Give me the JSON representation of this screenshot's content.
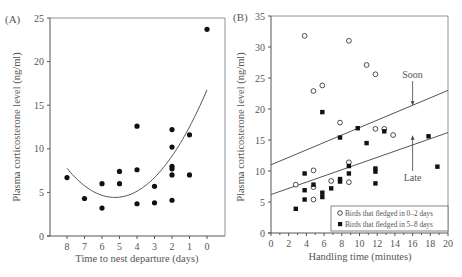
{
  "chart_data": [
    {
      "panel": "(A)",
      "type": "scatter",
      "title": "",
      "xlabel": "Time to nest departure (days)",
      "ylabel": "Plasma corticosterone level (ng/ml)",
      "x_reversed": true,
      "xlim": [
        8.9,
        -1
      ],
      "ylim": [
        0,
        25
      ],
      "xticks": [
        8,
        7,
        6,
        5,
        4,
        3,
        2,
        1,
        0
      ],
      "yticks": [
        0,
        5,
        10,
        15,
        20,
        25
      ],
      "grid": false,
      "series": [
        {
          "name": "Birds",
          "marker": "filled-circle",
          "points": [
            [
              8,
              6.7
            ],
            [
              7,
              4.3
            ],
            [
              6,
              6.0
            ],
            [
              6,
              3.2
            ],
            [
              5,
              7.4
            ],
            [
              5,
              6.0
            ],
            [
              4,
              12.6
            ],
            [
              4,
              7.6
            ],
            [
              4,
              3.7
            ],
            [
              3,
              5.7
            ],
            [
              3,
              3.8
            ],
            [
              2,
              12.2
            ],
            [
              2,
              10.2
            ],
            [
              2,
              8.0
            ],
            [
              2,
              7.7
            ],
            [
              2,
              7.0
            ],
            [
              2,
              4.1
            ],
            [
              1,
              11.6
            ],
            [
              1,
              7.0
            ],
            [
              0,
              23.7
            ]
          ]
        }
      ],
      "fit": {
        "type": "quadratic",
        "points": [
          [
            8,
            7.7
          ],
          [
            7,
            5.8
          ],
          [
            6,
            4.8
          ],
          [
            5,
            4.5
          ],
          [
            4,
            5.0
          ],
          [
            3,
            6.5
          ],
          [
            2,
            9.2
          ],
          [
            1,
            12.8
          ],
          [
            0,
            16.6
          ]
        ]
      }
    },
    {
      "panel": "(B)",
      "type": "scatter",
      "title": "",
      "xlabel": "Handling time (minutes)",
      "ylabel": "Plasma corticosterone level (ng/ml)",
      "xlim": [
        0,
        20
      ],
      "ylim": [
        0,
        35
      ],
      "xticks": [
        0,
        2,
        4,
        6,
        8,
        10,
        12,
        14,
        16,
        18,
        20
      ],
      "yticks": [
        0,
        5,
        10,
        15,
        20,
        25,
        30,
        35
      ],
      "grid": false,
      "legend_position": "lower right",
      "series": [
        {
          "name": "Birds that fledged in 0–2 days",
          "marker": "open-circle",
          "points": [
            [
              3.8,
              31.8
            ],
            [
              4.8,
              22.9
            ],
            [
              5.8,
              23.8
            ],
            [
              7.8,
              17.8
            ],
            [
              8.8,
              31.0
            ],
            [
              10.8,
              27.1
            ],
            [
              11.8,
              25.6
            ],
            [
              11.8,
              16.8
            ],
            [
              12.8,
              16.8
            ],
            [
              13.8,
              15.8
            ],
            [
              2.8,
              7.8
            ],
            [
              4.8,
              10.1
            ],
            [
              4.8,
              7.4
            ],
            [
              4.8,
              5.4
            ],
            [
              6.8,
              8.4
            ],
            [
              8.8,
              11.4
            ],
            [
              8.8,
              8.2
            ]
          ]
        },
        {
          "name": "Birds that fledged in 5–8 days",
          "marker": "filled-square",
          "points": [
            [
              2.8,
              3.9
            ],
            [
              3.8,
              9.6
            ],
            [
              3.8,
              6.9
            ],
            [
              3.8,
              5.4
            ],
            [
              4.8,
              7.8
            ],
            [
              5.8,
              19.5
            ],
            [
              5.8,
              6.5
            ],
            [
              5.8,
              5.8
            ],
            [
              6.8,
              7.2
            ],
            [
              7.8,
              15.4
            ],
            [
              7.8,
              8.7
            ],
            [
              7.8,
              8.3
            ],
            [
              8.8,
              10.8
            ],
            [
              8.8,
              9.6
            ],
            [
              9.8,
              16.9
            ],
            [
              10.8,
              14.5
            ],
            [
              11.8,
              10.4
            ],
            [
              11.8,
              9.9
            ],
            [
              11.8,
              8.0
            ],
            [
              12.8,
              16.4
            ],
            [
              17.8,
              15.6
            ],
            [
              18.8,
              10.7
            ]
          ]
        }
      ],
      "fit_lines": [
        {
          "name": "Soon",
          "start": [
            0,
            11.0
          ],
          "end": [
            20,
            23.0
          ]
        },
        {
          "name": "Late",
          "start": [
            0,
            6.2
          ],
          "end": [
            20,
            16.2
          ]
        }
      ],
      "annotations": [
        {
          "text": "Soon",
          "x": 16,
          "y": 25.0,
          "arrow_to": [
            16,
            20.6
          ]
        },
        {
          "text": "Late",
          "x": 16,
          "y": 10.0,
          "arrow_to": [
            16,
            15.7
          ]
        }
      ]
    }
  ]
}
